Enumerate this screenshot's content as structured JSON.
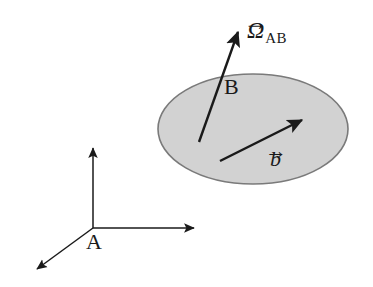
{
  "figure": {
    "background_color": "#ffffff",
    "stroke_color": "#1a1a1a",
    "body": {
      "name": "ellipse-body-B",
      "label": "B",
      "fill_color": "#d2d2d2",
      "outline_color": "#7a7a7a",
      "center": {
        "x": 253,
        "y": 129
      },
      "radius_x": 95,
      "radius_y": 55
    },
    "frame": {
      "name": "reference-frame-A",
      "origin_label": "A",
      "origin": {
        "x": 93,
        "y": 228
      },
      "axes": [
        {
          "name": "axis-vertical",
          "tip": {
            "x": 93,
            "y": 145
          }
        },
        {
          "name": "axis-horizontal",
          "tip": {
            "x": 198,
            "y": 228
          }
        },
        {
          "name": "axis-diagonal",
          "tip": {
            "x": 33,
            "y": 272
          }
        }
      ]
    },
    "vectors": [
      {
        "name": "angular-velocity-vector",
        "symbol": "Ω",
        "subscript": "AB",
        "accent": "→",
        "tail": {
          "x": 199,
          "y": 142
        },
        "tip": {
          "x": 241,
          "y": 25
        }
      },
      {
        "name": "position-vector-b",
        "symbol": "b",
        "subscript": "",
        "accent": "→",
        "tail": {
          "x": 220,
          "y": 161
        },
        "tip": {
          "x": 307,
          "y": 117
        }
      }
    ]
  }
}
